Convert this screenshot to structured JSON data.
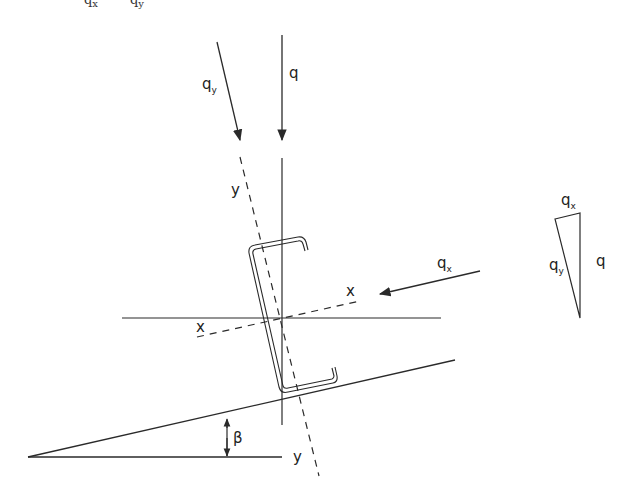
{
  "figure": {
    "type": "structural-load-diagram",
    "colors": {
      "line": "#2a2a2a",
      "background": "#ffffff"
    }
  },
  "top_clipped_text": {
    "left": "q",
    "left_sub": "x",
    "right": "q",
    "right_sub": "y"
  },
  "loads": {
    "q": {
      "label": "q"
    },
    "qy": {
      "label": "q",
      "sub": "y"
    },
    "qx": {
      "label": "q",
      "sub": "x"
    }
  },
  "axes": {
    "y_top": "y",
    "y_bottom": "y",
    "x_right": "x",
    "x_left": "x"
  },
  "angle": {
    "label": "β"
  },
  "force_triangle": {
    "qx": {
      "label": "q",
      "sub": "x"
    },
    "qy": {
      "label": "q",
      "sub": "y"
    },
    "q": {
      "label": "q"
    }
  }
}
